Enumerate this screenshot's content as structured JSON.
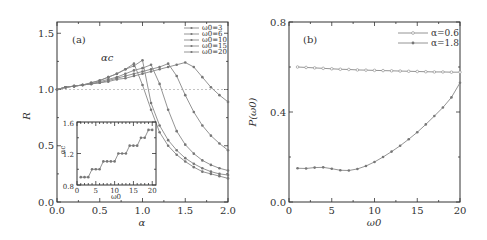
{
  "chart_data": [
    {
      "panel": "(a)",
      "type": "line",
      "xlabel": "α",
      "ylabel": "R",
      "xlim": [
        0.0,
        2.0
      ],
      "ylim": [
        0.0,
        1.6
      ],
      "xticks": [
        "0.0",
        "0.5",
        "1.0",
        "1.5",
        "2.0"
      ],
      "yticks": [
        "0.0",
        "0.5",
        "1.0",
        "1.5"
      ],
      "annotation": "αc",
      "reference_line": {
        "y": 1.0,
        "style": "dashed"
      },
      "legend_position": "upper right",
      "x": [
        0.0,
        0.1,
        0.2,
        0.3,
        0.4,
        0.5,
        0.6,
        0.7,
        0.8,
        0.9,
        1.0,
        1.1,
        1.2,
        1.3,
        1.4,
        1.5,
        1.6,
        1.7,
        1.8,
        1.9,
        2.0
      ],
      "series": [
        {
          "name": "ω0=3",
          "values": [
            1.0,
            1.02,
            1.03,
            1.04,
            1.06,
            1.08,
            1.11,
            1.14,
            1.18,
            1.23,
            1.04,
            0.82,
            0.62,
            0.5,
            0.42,
            0.36,
            0.31,
            0.27,
            0.25,
            0.23,
            0.21
          ]
        },
        {
          "name": "ω0=6",
          "values": [
            1.0,
            1.02,
            1.03,
            1.04,
            1.06,
            1.08,
            1.11,
            1.14,
            1.18,
            1.21,
            1.26,
            0.88,
            0.68,
            0.55,
            0.46,
            0.39,
            0.34,
            0.3,
            0.27,
            0.25,
            0.24
          ]
        },
        {
          "name": "ω0=10",
          "values": [
            1.0,
            1.02,
            1.03,
            1.04,
            1.05,
            1.07,
            1.09,
            1.11,
            1.14,
            1.17,
            1.19,
            1.22,
            1.05,
            0.82,
            0.63,
            0.51,
            0.43,
            0.37,
            0.33,
            0.3,
            0.28
          ]
        },
        {
          "name": "ω0=15",
          "values": [
            1.0,
            1.02,
            1.03,
            1.04,
            1.05,
            1.06,
            1.08,
            1.1,
            1.12,
            1.14,
            1.16,
            1.18,
            1.2,
            1.23,
            1.12,
            0.95,
            0.8,
            0.68,
            0.59,
            0.52,
            0.46
          ]
        },
        {
          "name": "ω0=20",
          "values": [
            1.0,
            1.02,
            1.03,
            1.04,
            1.05,
            1.06,
            1.07,
            1.09,
            1.1,
            1.12,
            1.14,
            1.16,
            1.18,
            1.2,
            1.22,
            1.24,
            1.2,
            1.11,
            1.02,
            0.95,
            0.89
          ]
        }
      ],
      "inset": {
        "type": "line",
        "xlabel": "ω0",
        "ylabel": "αc",
        "xlim": [
          0,
          21
        ],
        "ylim": [
          0.8,
          1.6
        ],
        "xticks": [
          "0",
          "5",
          "10",
          "15",
          "20"
        ],
        "yticks": [
          "0.8",
          "1.2",
          "1.6"
        ],
        "x": [
          1,
          2,
          3,
          4,
          5,
          6,
          7,
          8,
          9,
          10,
          11,
          12,
          13,
          14,
          15,
          16,
          17,
          18,
          19,
          20
        ],
        "values": [
          0.9,
          0.9,
          0.9,
          1.0,
          1.0,
          1.0,
          1.1,
          1.1,
          1.1,
          1.1,
          1.2,
          1.2,
          1.2,
          1.3,
          1.3,
          1.3,
          1.4,
          1.4,
          1.5,
          1.5
        ]
      }
    },
    {
      "panel": "(b)",
      "type": "line",
      "xlabel": "ω0",
      "ylabel": "P(ω0)",
      "xlim": [
        0,
        20
      ],
      "ylim": [
        0.0,
        0.8
      ],
      "xticks": [
        "0",
        "5",
        "10",
        "15",
        "20"
      ],
      "yticks": [
        "0.0",
        "0.4",
        "0.8"
      ],
      "legend_position": "upper right",
      "x": [
        1,
        2,
        3,
        4,
        5,
        6,
        7,
        8,
        9,
        10,
        11,
        12,
        13,
        14,
        15,
        16,
        17,
        18,
        19,
        20
      ],
      "series": [
        {
          "name": "α=0.6",
          "values": [
            0.6,
            0.598,
            0.596,
            0.594,
            0.592,
            0.59,
            0.589,
            0.587,
            0.586,
            0.585,
            0.584,
            0.583,
            0.582,
            0.581,
            0.58,
            0.579,
            0.578,
            0.578,
            0.577,
            0.577
          ]
        },
        {
          "name": "α=1.8",
          "values": [
            0.15,
            0.149,
            0.153,
            0.154,
            0.148,
            0.141,
            0.14,
            0.147,
            0.16,
            0.178,
            0.2,
            0.224,
            0.25,
            0.279,
            0.31,
            0.345,
            0.382,
            0.42,
            0.465,
            0.53
          ]
        }
      ]
    }
  ],
  "labels": {
    "panel_a": "(a)",
    "panel_b": "(b)",
    "alpha_c": "αc",
    "a_xlabel": "α",
    "a_ylabel": "R",
    "b_xlabel": "ω0",
    "b_ylabel": "P(ω0)",
    "inset_xlabel": "ω0",
    "inset_ylabel": "αc"
  }
}
